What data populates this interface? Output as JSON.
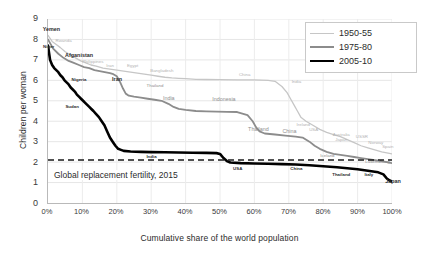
{
  "chart_data": {
    "type": "line",
    "title": "",
    "xlabel": "Cumulative share of the world population",
    "ylabel": "Children per woman",
    "xlim": [
      0,
      100
    ],
    "ylim": [
      0,
      9
    ],
    "grid": true,
    "legend_position": "top-right",
    "xticks": [
      "0%",
      "10%",
      "20%",
      "30%",
      "40%",
      "50%",
      "60%",
      "70%",
      "80%",
      "90%",
      "100%"
    ],
    "xtick_values": [
      0,
      10,
      20,
      30,
      40,
      50,
      60,
      70,
      80,
      90,
      100
    ],
    "yticks": [
      "0",
      "1",
      "2",
      "3",
      "4",
      "5",
      "6",
      "7",
      "8",
      "9"
    ],
    "ytick_values": [
      0,
      1,
      2,
      3,
      4,
      5,
      6,
      7,
      8,
      9
    ],
    "reference_line": {
      "label": "Global replacement fertility, 2015",
      "value": 2.1,
      "style": "dashed",
      "color": "#1a1a1a"
    },
    "series": [
      {
        "name": "1950-55",
        "color": "#c6c6c6",
        "width": 1.3,
        "points": [
          [
            0,
            8.2
          ],
          [
            1.2,
            7.9
          ],
          [
            2.4,
            7.75
          ],
          [
            3.6,
            7.6
          ],
          [
            5,
            7.4
          ],
          [
            6.5,
            7.25
          ],
          [
            8,
            7.1
          ],
          [
            9.5,
            6.95
          ],
          [
            11,
            6.85
          ],
          [
            12.5,
            6.75
          ],
          [
            14,
            6.7
          ],
          [
            16,
            6.6
          ],
          [
            18,
            6.55
          ],
          [
            20,
            6.5
          ],
          [
            22,
            6.45
          ],
          [
            24,
            6.4
          ],
          [
            26,
            6.35
          ],
          [
            28,
            6.3
          ],
          [
            30,
            6.25
          ],
          [
            32,
            6.2
          ],
          [
            34,
            6.15
          ],
          [
            36,
            6.12
          ],
          [
            38,
            6.1
          ],
          [
            40,
            6.08
          ],
          [
            43,
            6.05
          ],
          [
            46,
            6.04
          ],
          [
            50,
            6.03
          ],
          [
            55,
            6.02
          ],
          [
            60,
            6.02
          ],
          [
            64,
            6.0
          ],
          [
            66,
            5.95
          ],
          [
            68,
            5.7
          ],
          [
            69.5,
            5.4
          ],
          [
            70.5,
            5.1
          ],
          [
            71.5,
            4.8
          ],
          [
            72.5,
            4.5
          ],
          [
            73.5,
            4.2
          ],
          [
            75,
            4.0
          ],
          [
            77,
            3.8
          ],
          [
            79,
            3.6
          ],
          [
            81,
            3.45
          ],
          [
            83,
            3.35
          ],
          [
            85,
            3.25
          ],
          [
            87,
            3.1
          ],
          [
            89,
            2.95
          ],
          [
            91,
            2.8
          ],
          [
            93,
            2.7
          ],
          [
            95,
            2.6
          ],
          [
            97,
            2.5
          ],
          [
            98.5,
            2.45
          ],
          [
            100,
            2.4
          ]
        ]
      },
      {
        "name": "1975-80",
        "color": "#8c8c8c",
        "width": 1.8,
        "points": [
          [
            0,
            8.0
          ],
          [
            1.5,
            7.55
          ],
          [
            3,
            7.3
          ],
          [
            4.5,
            7.1
          ],
          [
            6,
            6.95
          ],
          [
            7.5,
            6.85
          ],
          [
            9,
            6.75
          ],
          [
            10.5,
            6.65
          ],
          [
            12,
            6.6
          ],
          [
            13.5,
            6.5
          ],
          [
            15,
            6.45
          ],
          [
            16.5,
            6.4
          ],
          [
            18,
            6.35
          ],
          [
            19,
            6.3
          ],
          [
            20,
            6.2
          ],
          [
            21,
            5.9
          ],
          [
            21.8,
            5.6
          ],
          [
            22.6,
            5.35
          ],
          [
            23.5,
            5.25
          ],
          [
            25,
            5.2
          ],
          [
            27,
            5.15
          ],
          [
            29,
            5.1
          ],
          [
            31,
            5.05
          ],
          [
            33,
            5.0
          ],
          [
            35,
            4.85
          ],
          [
            36.5,
            4.7
          ],
          [
            38,
            4.6
          ],
          [
            40,
            4.55
          ],
          [
            43,
            4.5
          ],
          [
            46,
            4.48
          ],
          [
            49,
            4.47
          ],
          [
            52,
            4.46
          ],
          [
            55,
            4.45
          ],
          [
            58,
            4.3
          ],
          [
            59.5,
            4.0
          ],
          [
            60.5,
            3.7
          ],
          [
            61.5,
            3.5
          ],
          [
            63,
            3.4
          ],
          [
            66,
            3.35
          ],
          [
            69,
            3.3
          ],
          [
            72,
            3.25
          ],
          [
            74,
            3.2
          ],
          [
            76,
            3.0
          ],
          [
            77.5,
            2.8
          ],
          [
            79,
            2.65
          ],
          [
            81,
            2.5
          ],
          [
            83,
            2.4
          ],
          [
            85,
            2.35
          ],
          [
            87,
            2.3
          ],
          [
            89,
            2.25
          ],
          [
            91,
            2.2
          ],
          [
            93,
            2.15
          ],
          [
            95,
            2.1
          ],
          [
            97,
            2.05
          ],
          [
            98.5,
            2.0
          ],
          [
            100,
            1.95
          ]
        ]
      },
      {
        "name": "2005-10",
        "color": "#000000",
        "width": 2.6,
        "points": [
          [
            0,
            7.7
          ],
          [
            0.6,
            7.0
          ],
          [
            1.2,
            6.75
          ],
          [
            1.8,
            6.6
          ],
          [
            2.4,
            6.5
          ],
          [
            3,
            6.4
          ],
          [
            3.6,
            6.25
          ],
          [
            4.2,
            6.15
          ],
          [
            4.8,
            6.0
          ],
          [
            5.4,
            5.9
          ],
          [
            6,
            5.8
          ],
          [
            6.6,
            5.65
          ],
          [
            7.2,
            5.55
          ],
          [
            7.8,
            5.45
          ],
          [
            8.4,
            5.3
          ],
          [
            9,
            5.2
          ],
          [
            9.6,
            5.1
          ],
          [
            10.2,
            5.0
          ],
          [
            10.8,
            4.9
          ],
          [
            11.4,
            4.8
          ],
          [
            12,
            4.7
          ],
          [
            12.6,
            4.6
          ],
          [
            13.2,
            4.5
          ],
          [
            14,
            4.35
          ],
          [
            14.8,
            4.2
          ],
          [
            15.6,
            4.0
          ],
          [
            16.4,
            3.8
          ],
          [
            17.2,
            3.5
          ],
          [
            18,
            3.2
          ],
          [
            18.8,
            3.0
          ],
          [
            19.6,
            2.8
          ],
          [
            20.4,
            2.65
          ],
          [
            21.2,
            2.6
          ],
          [
            22,
            2.55
          ],
          [
            24,
            2.52
          ],
          [
            27,
            2.5
          ],
          [
            30,
            2.49
          ],
          [
            34,
            2.48
          ],
          [
            38,
            2.47
          ],
          [
            42,
            2.46
          ],
          [
            46,
            2.45
          ],
          [
            49,
            2.44
          ],
          [
            50,
            2.4
          ],
          [
            51,
            2.2
          ],
          [
            52,
            2.05
          ],
          [
            53,
            1.98
          ],
          [
            56,
            1.95
          ],
          [
            60,
            1.93
          ],
          [
            64,
            1.92
          ],
          [
            68,
            1.9
          ],
          [
            72,
            1.88
          ],
          [
            76,
            1.85
          ],
          [
            80,
            1.8
          ],
          [
            84,
            1.75
          ],
          [
            87,
            1.7
          ],
          [
            90,
            1.65
          ],
          [
            92,
            1.6
          ],
          [
            94,
            1.55
          ],
          [
            96,
            1.5
          ],
          [
            97.5,
            1.4
          ],
          [
            98.5,
            1.2
          ],
          [
            99.3,
            1.1
          ],
          [
            100,
            1.05
          ]
        ]
      }
    ],
    "annotations": [
      {
        "text": "Yemen",
        "series": "2005-10",
        "x": 1.0,
        "y": 8.45,
        "emphasis": "big"
      },
      {
        "text": "Niger",
        "series": "2005-10",
        "x": 0.2,
        "y": 7.62,
        "emphasis": "normal"
      },
      {
        "text": "Rwanda",
        "series": "1950-55",
        "x": 4.5,
        "y": 7.95,
        "emphasis": "normal"
      },
      {
        "text": "Afganistan",
        "series": "2005-10",
        "x": 9.0,
        "y": 7.22,
        "emphasis": "big"
      },
      {
        "text": "Philippines",
        "series": "1950-55",
        "x": 13.0,
        "y": 6.92,
        "emphasis": "normal"
      },
      {
        "text": "Iran",
        "series": "1950-55",
        "x": 18.0,
        "y": 6.72,
        "emphasis": "normal"
      },
      {
        "text": "Egypt",
        "series": "1950-55",
        "x": 24.5,
        "y": 6.72,
        "emphasis": "normal"
      },
      {
        "text": "Bangladesh",
        "series": "1950-55",
        "x": 33.0,
        "y": 6.45,
        "emphasis": "normal"
      },
      {
        "text": "China",
        "series": "1950-55",
        "x": 57.0,
        "y": 6.28,
        "emphasis": "normal"
      },
      {
        "text": "India",
        "series": "1950-55",
        "x": 72.0,
        "y": 5.95,
        "emphasis": "normal"
      },
      {
        "text": "Nigeria",
        "series": "2005-10",
        "x": 9.0,
        "y": 6.05,
        "emphasis": "normal"
      },
      {
        "text": "Iran",
        "series": "2005-10",
        "x": 20.0,
        "y": 6.05,
        "emphasis": "big"
      },
      {
        "text": "Thailand",
        "series": "1975-80",
        "x": 31.0,
        "y": 5.72,
        "emphasis": "normal"
      },
      {
        "text": "Sudan",
        "series": "2005-10",
        "x": 7.0,
        "y": 4.72,
        "emphasis": "normal"
      },
      {
        "text": "India",
        "series": "1975-80",
        "x": 35.0,
        "y": 5.1,
        "emphasis": "big"
      },
      {
        "text": "Indonesia",
        "series": "1975-80",
        "x": 51.0,
        "y": 5.05,
        "emphasis": "big"
      },
      {
        "text": "Thailand",
        "series": "1975-80",
        "x": 61.0,
        "y": 3.58,
        "emphasis": "big"
      },
      {
        "text": "China",
        "series": "1975-80",
        "x": 70.0,
        "y": 3.5,
        "emphasis": "big"
      },
      {
        "text": "Ireland",
        "series": "1950-55",
        "x": 74.0,
        "y": 3.85,
        "emphasis": "normal"
      },
      {
        "text": "USA",
        "series": "1950-55",
        "x": 77.0,
        "y": 3.6,
        "emphasis": "normal"
      },
      {
        "text": "Australia",
        "series": "1950-55",
        "x": 85.0,
        "y": 3.38,
        "emphasis": "normal"
      },
      {
        "text": "Japan",
        "series": "1950-55",
        "x": 85.0,
        "y": 3.12,
        "emphasis": "normal"
      },
      {
        "text": "USSR",
        "series": "1950-55",
        "x": 91.0,
        "y": 3.28,
        "emphasis": "normal"
      },
      {
        "text": "Norway",
        "series": "1950-55",
        "x": 95.0,
        "y": 2.95,
        "emphasis": "normal"
      },
      {
        "text": "Spain",
        "series": "1950-55",
        "x": 98.5,
        "y": 2.78,
        "emphasis": "normal"
      },
      {
        "text": "India",
        "series": "2005-10",
        "x": 30.0,
        "y": 2.28,
        "emphasis": "normal"
      },
      {
        "text": "USA",
        "series": "2005-10",
        "x": 55.0,
        "y": 1.72,
        "emphasis": "normal"
      },
      {
        "text": "China",
        "series": "2005-10",
        "x": 72.0,
        "y": 1.72,
        "emphasis": "normal"
      },
      {
        "text": "Iceland",
        "series": "1975-80",
        "x": 81.0,
        "y": 2.32,
        "emphasis": "normal"
      },
      {
        "text": "Luxembourg",
        "series": "1975-80",
        "x": 95.5,
        "y": 2.02,
        "emphasis": "normal"
      },
      {
        "text": "Thailand",
        "series": "2005-10",
        "x": 85.0,
        "y": 1.42,
        "emphasis": "normal"
      },
      {
        "text": "Italy",
        "series": "2005-10",
        "x": 93.0,
        "y": 1.42,
        "emphasis": "normal"
      },
      {
        "text": "Japan",
        "series": "2005-10",
        "x": 100.0,
        "y": 1.05,
        "emphasis": "big"
      }
    ]
  }
}
